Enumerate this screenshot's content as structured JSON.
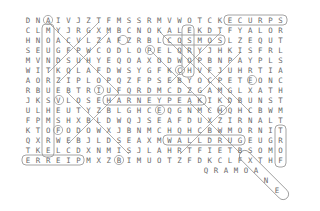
{
  "puzzle": {
    "title": "word-search-grid",
    "colors": {
      "background": "#ffffff",
      "letter": "#6a6a6a",
      "annotation": "#9a9a9a"
    },
    "grid_rows": [
      "DNAIVJZTFMSSRMVWOTCKECURPS",
      "CLMYJRGXMBCNOKALEKDTFYALOR",
      "HNOACVLZAFZRBLCOSMOSLZEQUT",
      "SEUGFPWCODLOPELQRYJHKISFRL",
      "MVNDSUHYEQOAXODWOPBNPAYPLS",
      "WITKQLAFDWSYGFKCHVFJUHRTIA",
      "AORZIPLOPQZFPSEBYOCPETEONC",
      "RBUEBTRIUFQRDMCDZGAMGLXATH",
      "JKSVLOSEHARNEYPEAKIKDBUNST",
      "ULHEUTYZBLGHCEQGNMCHQHCBWM",
      "FPMSHXBLDWQJSEAFDUXZIRNALT",
      "KTOFODOWXJBNMCHQHCBWMORNIT",
      "QXRWEBJLDSEAXMWALLDRUGEUGR",
      "TKELCDXNMISJLAHRTFIETBSOMO",
      "ERREIPMXZBIMUOTZFDKCLFXTHF"
    ],
    "overflow_letters": [
      {
        "ch": "Q",
        "x": 206,
        "y": 170
      },
      {
        "ch": "R",
        "x": 216,
        "y": 170
      },
      {
        "ch": "A",
        "x": 226,
        "y": 170
      },
      {
        "ch": "M",
        "x": 236,
        "y": 170
      },
      {
        "ch": "O",
        "x": 246,
        "y": 170
      },
      {
        "ch": "A",
        "x": 256,
        "y": 170
      },
      {
        "ch": "N",
        "x": 266,
        "y": 180
      },
      {
        "ch": "E",
        "x": 277,
        "y": 190
      }
    ],
    "marked_words": [
      {
        "word": "MOUNT RUSHMORE",
        "shape": "rect",
        "x": 42,
        "y": 24,
        "w": 12,
        "h": 133
      },
      {
        "word": "SPRUCE",
        "shape": "rect",
        "x": 224,
        "y": 15,
        "w": 63,
        "h": 10
      },
      {
        "word": "HORSE",
        "shape": "rect",
        "x": 182,
        "y": 25,
        "w": 12,
        "h": 52
      },
      {
        "word": "COSMOS",
        "shape": "rect",
        "x": 163,
        "y": 35,
        "w": 62,
        "h": 10
      },
      {
        "word": "HARNEY PEAK",
        "shape": "rect",
        "x": 103,
        "y": 95,
        "w": 103,
        "h": 10
      },
      {
        "word": "WALL DRUG",
        "shape": "rect",
        "x": 163,
        "y": 135,
        "w": 82,
        "h": 10
      },
      {
        "word": "PIERRE",
        "shape": "rect",
        "x": 22,
        "y": 155,
        "w": 62,
        "h": 10
      },
      {
        "word": "FORT",
        "shape": "rect",
        "x": 275,
        "y": 125,
        "w": 11,
        "h": 42
      },
      {
        "word": "KEYSTONE",
        "shape": "diagonal-capsule",
        "x1": 241,
        "y1": 152,
        "x2": 287,
        "y2": 198
      }
    ],
    "strike_lines": [
      {
        "x1": 48,
        "y1": 22,
        "x2": 119,
        "y2": 93
      },
      {
        "x1": 109,
        "y1": 32,
        "x2": 58,
        "y2": 83
      },
      {
        "x1": 99,
        "y1": 22,
        "x2": 48,
        "y2": 73
      },
      {
        "x1": 160,
        "y1": 32,
        "x2": 231,
        "y2": 103
      },
      {
        "x1": 221,
        "y1": 32,
        "x2": 170,
        "y2": 83
      },
      {
        "x1": 180,
        "y1": 42,
        "x2": 251,
        "y2": 113
      },
      {
        "x1": 241,
        "y1": 52,
        "x2": 200,
        "y2": 93
      },
      {
        "x1": 150,
        "y1": 50,
        "x2": 211,
        "y2": 111
      },
      {
        "x1": 68,
        "y1": 93,
        "x2": 129,
        "y2": 154
      },
      {
        "x1": 119,
        "y1": 93,
        "x2": 68,
        "y2": 144
      },
      {
        "x1": 190,
        "y1": 103,
        "x2": 241,
        "y2": 154
      },
      {
        "x1": 231,
        "y1": 103,
        "x2": 180,
        "y2": 154
      }
    ],
    "circled_letters": [
      {
        "x": 48,
        "y": 20
      },
      {
        "x": 123,
        "y": 40
      },
      {
        "x": 150,
        "y": 50
      },
      {
        "x": 180,
        "y": 70
      },
      {
        "x": 252,
        "y": 80
      },
      {
        "x": 99,
        "y": 90
      },
      {
        "x": 59,
        "y": 100
      },
      {
        "x": 160,
        "y": 110
      },
      {
        "x": 222,
        "y": 110
      },
      {
        "x": 58,
        "y": 130
      },
      {
        "x": 119,
        "y": 160
      }
    ],
    "geometry": {
      "x0": 28,
      "dx": 10.1,
      "y0": 20,
      "dy": 10
    }
  }
}
